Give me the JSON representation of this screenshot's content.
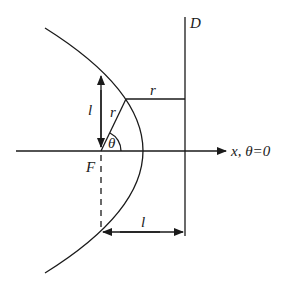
{
  "diagram": {
    "type": "parabola-focus-directrix",
    "labels": {
      "directrix": "D",
      "focus": "F",
      "axis": "x, θ=0",
      "angle": "θ",
      "radius_on_ray": "r",
      "radius_to_directrix": "r",
      "semi_latus_vertical": "l",
      "semi_latus_horizontal": "l"
    },
    "colors": {
      "stroke": "#1a1a1a",
      "background": "#ffffff"
    }
  }
}
